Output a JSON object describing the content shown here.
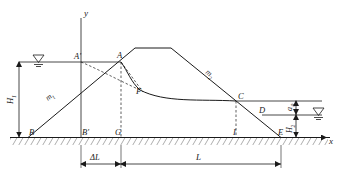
{
  "figure": {
    "type": "engineering-cross-section",
    "axes": {
      "y_label": "y",
      "x_label": "x"
    },
    "points": [
      {
        "id": "A-prime",
        "label": "A'",
        "x": 81,
        "y": 62
      },
      {
        "id": "A",
        "label": "A",
        "x": 121,
        "y": 62
      },
      {
        "id": "B",
        "label": "B",
        "x": 28,
        "y": 137
      },
      {
        "id": "B-prime",
        "label": "B'",
        "x": 81,
        "y": 137
      },
      {
        "id": "C",
        "label": "C",
        "x": 236,
        "y": 101
      },
      {
        "id": "D",
        "label": "D",
        "x": 262,
        "y": 115
      },
      {
        "id": "E",
        "label": "E",
        "x": 281,
        "y": 137
      },
      {
        "id": "F",
        "label": "F",
        "x": 136,
        "y": 89
      },
      {
        "id": "G",
        "label": "G",
        "x": 121,
        "y": 137
      },
      {
        "id": "I",
        "label": "I",
        "x": 236,
        "y": 137
      }
    ],
    "slope_labels": [
      {
        "id": "upstream-slope",
        "label": "m1",
        "base": "m",
        "sub": "1"
      },
      {
        "id": "downstream-slope",
        "label": "m2",
        "base": "m",
        "sub": "2"
      }
    ],
    "dimensions": [
      {
        "id": "upstream-head",
        "base": "H",
        "sub": "1",
        "orientation": "vertical"
      },
      {
        "id": "downstream-head",
        "base": "H",
        "sub": "2",
        "orientation": "vertical"
      },
      {
        "id": "seepage-exit-height",
        "base": "a",
        "sub": "0",
        "orientation": "vertical"
      },
      {
        "id": "delta-length",
        "base": "ΔL",
        "sub": "",
        "orientation": "horizontal"
      },
      {
        "id": "seepage-length",
        "base": "L",
        "sub": "",
        "orientation": "horizontal"
      }
    ],
    "symbols": [
      {
        "id": "upstream-water-level",
        "name": "water-level-symbol",
        "x": 38,
        "y": 62
      },
      {
        "id": "downstream-water-level",
        "name": "water-level-symbol",
        "x": 318,
        "y": 115
      }
    ],
    "colors": {
      "line": "#1a1a1a",
      "background": "#ffffff",
      "hatch": "#4a4a4a"
    }
  }
}
